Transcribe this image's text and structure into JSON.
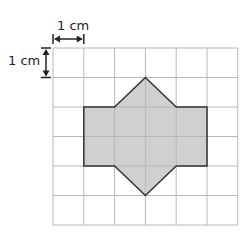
{
  "diagram": {
    "type": "grid-shape",
    "grid": {
      "cols": 6,
      "rows": 6,
      "origin_px": [
        53,
        48
      ],
      "cell_w_px": 30.8,
      "cell_h_px": 29.5,
      "line_color": "#b8b8b8"
    },
    "scale": {
      "horizontal_label": "1 cm",
      "vertical_label": "1 cm"
    },
    "shape": {
      "fill": "#d0d0d0",
      "stroke": "#333333",
      "vertices_grid": [
        [
          3,
          1
        ],
        [
          4,
          2
        ],
        [
          5,
          2
        ],
        [
          5,
          4
        ],
        [
          4,
          4
        ],
        [
          3,
          5
        ],
        [
          2,
          4
        ],
        [
          1,
          4
        ],
        [
          1,
          2
        ],
        [
          2,
          2
        ]
      ]
    }
  }
}
